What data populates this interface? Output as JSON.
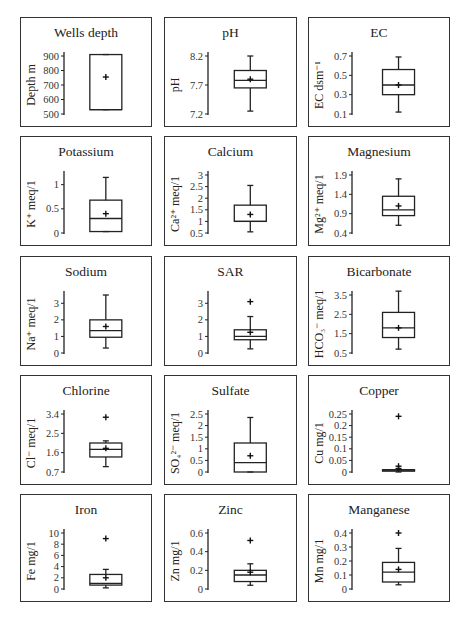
{
  "chart_data": [
    {
      "type": "box",
      "title": "Wells depth",
      "ylabel": "Depth m",
      "yticks": [
        "500",
        "600",
        "700",
        "800",
        "900"
      ],
      "ylim": [
        500,
        900
      ],
      "box": {
        "min": 530,
        "q1": 530,
        "median": 530,
        "q3": 910,
        "max": 910,
        "mean": 755,
        "outliers": []
      }
    },
    {
      "type": "box",
      "title": "pH",
      "ylabel": "pH",
      "yticks": [
        "7.2",
        "7.7",
        "8.2"
      ],
      "ylim": [
        7.2,
        8.2
      ],
      "box": {
        "min": 7.25,
        "q1": 7.65,
        "median": 7.78,
        "q3": 7.95,
        "max": 8.2,
        "mean": 7.8,
        "outliers": []
      }
    },
    {
      "type": "box",
      "title": "EC",
      "ylabel": "EC dsm-1",
      "yticks": [
        "0.1",
        "0.3",
        "0.5",
        "0.7"
      ],
      "ylim": [
        0.1,
        0.7
      ],
      "box": {
        "min": 0.12,
        "q1": 0.3,
        "median": 0.4,
        "q3": 0.56,
        "max": 0.69,
        "mean": 0.4,
        "outliers": []
      }
    },
    {
      "type": "box",
      "title": "Potassium",
      "ylabel": "K+ meq/1",
      "yticks": [
        "0",
        "0.5",
        "1"
      ],
      "ylim": [
        0,
        1.2
      ],
      "box": {
        "min": 0.03,
        "q1": 0.03,
        "median": 0.3,
        "q3": 0.68,
        "max": 1.15,
        "mean": 0.4,
        "outliers": []
      }
    },
    {
      "type": "box",
      "title": "Calcium",
      "ylabel": "Ca2+ meq/1",
      "yticks": [
        "0.5",
        "1",
        "1.5",
        "2",
        "2.5",
        "3"
      ],
      "ylim": [
        0.5,
        3
      ],
      "box": {
        "min": 0.55,
        "q1": 1.0,
        "median": 1.0,
        "q3": 1.7,
        "max": 2.55,
        "mean": 1.3,
        "outliers": []
      }
    },
    {
      "type": "box",
      "title": "Magnesium",
      "ylabel": "Mg2+ meq/1",
      "yticks": [
        "0.4",
        "0.9",
        "1.4",
        "1.9"
      ],
      "ylim": [
        0.4,
        1.9
      ],
      "box": {
        "min": 0.6,
        "q1": 0.85,
        "median": 1.0,
        "q3": 1.35,
        "max": 1.8,
        "mean": 1.1,
        "outliers": []
      }
    },
    {
      "type": "box",
      "title": "Sodium",
      "ylabel": "Na+ meq/1",
      "yticks": [
        "0",
        "1",
        "2",
        "3"
      ],
      "ylim": [
        0,
        3.5
      ],
      "box": {
        "min": 0.3,
        "q1": 0.95,
        "median": 1.35,
        "q3": 2.0,
        "max": 3.5,
        "mean": 1.6,
        "outliers": []
      }
    },
    {
      "type": "box",
      "title": "SAR",
      "ylabel": "",
      "yticks": [
        "0",
        "1",
        "2",
        "3"
      ],
      "ylim": [
        0,
        3.5
      ],
      "box": {
        "min": 0.25,
        "q1": 0.8,
        "median": 1.0,
        "q3": 1.4,
        "max": 2.2,
        "mean": 1.25,
        "outliers": [
          3.1
        ]
      }
    },
    {
      "type": "box",
      "title": "Bicarbonate",
      "ylabel": "HCO3- meq/1",
      "yticks": [
        "0.5",
        "1.5",
        "2.5",
        "3.5"
      ],
      "ylim": [
        0.5,
        3.5
      ],
      "box": {
        "min": 0.7,
        "q1": 1.3,
        "median": 1.8,
        "q3": 2.6,
        "max": 3.7,
        "mean": 1.8,
        "outliers": []
      }
    },
    {
      "type": "box",
      "title": "Chlorine",
      "ylabel": "Cl- meq/1",
      "yticks": [
        "0.7",
        "1.6",
        "2.5",
        "3.4"
      ],
      "ylim": [
        0.7,
        3.4
      ],
      "box": {
        "min": 0.95,
        "q1": 1.4,
        "median": 1.75,
        "q3": 2.05,
        "max": 2.15,
        "mean": 1.8,
        "outliers": [
          3.25
        ]
      }
    },
    {
      "type": "box",
      "title": "Sulfate",
      "ylabel": "SO42- meq/1",
      "yticks": [
        "0",
        "0.5",
        "1",
        "1.5",
        "2",
        "2.5"
      ],
      "ylim": [
        0,
        2.5
      ],
      "box": {
        "min": 0.0,
        "q1": 0.0,
        "median": 0.4,
        "q3": 1.25,
        "max": 2.35,
        "mean": 0.7,
        "outliers": []
      }
    },
    {
      "type": "box",
      "title": "Copper",
      "ylabel": "Cu mg/1",
      "yticks": [
        "0",
        "0.05",
        "0.1",
        "0.15",
        "0.2",
        "0.25"
      ],
      "ylim": [
        0,
        0.25
      ],
      "box": {
        "min": 0.0,
        "q1": 0.005,
        "median": 0.008,
        "q3": 0.01,
        "max": 0.01,
        "mean": 0.015,
        "outliers": [
          0.24,
          0.025
        ]
      }
    },
    {
      "type": "box",
      "title": "Iron",
      "ylabel": "Fe mg/1",
      "yticks": [
        "0",
        "2",
        "4",
        "6",
        "8",
        "10"
      ],
      "ylim": [
        0,
        10
      ],
      "box": {
        "min": 0.2,
        "q1": 0.7,
        "median": 1.0,
        "q3": 2.6,
        "max": 3.5,
        "mean": 2.0,
        "outliers": [
          9.0
        ]
      }
    },
    {
      "type": "box",
      "title": "Zinc",
      "ylabel": "Zn mg/1",
      "yticks": [
        "0",
        "0.2",
        "0.4",
        "0.6"
      ],
      "ylim": [
        0,
        0.6
      ],
      "box": {
        "min": 0.04,
        "q1": 0.08,
        "median": 0.15,
        "q3": 0.2,
        "max": 0.27,
        "mean": 0.18,
        "outliers": [
          0.52
        ]
      }
    },
    {
      "type": "box",
      "title": "Manganese",
      "ylabel": "Mn mg/1",
      "yticks": [
        "0",
        "0.1",
        "0.2",
        "0.3",
        "0.4"
      ],
      "ylim": [
        0,
        0.4
      ],
      "box": {
        "min": 0.03,
        "q1": 0.05,
        "median": 0.12,
        "q3": 0.19,
        "max": 0.29,
        "mean": 0.14,
        "outliers": [
          0.4
        ]
      }
    }
  ],
  "panels": [
    {
      "title": "Wells depth",
      "ylabel": "Depth m"
    },
    {
      "title": "pH",
      "ylabel": "pH"
    },
    {
      "title": "EC",
      "ylabel": "EC dsm⁻¹"
    },
    {
      "title": "Potassium",
      "ylabel": "K⁺ meq/1"
    },
    {
      "title": "Calcium",
      "ylabel": "Ca²⁺ meq/1"
    },
    {
      "title": "Magnesium",
      "ylabel": "Mg²⁺ meq/1"
    },
    {
      "title": "Sodium",
      "ylabel": "Na⁺ meq/1"
    },
    {
      "title": "SAR",
      "ylabel": ""
    },
    {
      "title": "Bicarbonate",
      "ylabel": "HCO₃⁻ meq/1"
    },
    {
      "title": "Chlorine",
      "ylabel": "Cl⁻ meq/1"
    },
    {
      "title": "Sulfate",
      "ylabel": "SO₄²⁻ meq/1"
    },
    {
      "title": "Copper",
      "ylabel": "Cu mg/1"
    },
    {
      "title": "Iron",
      "ylabel": "Fe mg/1"
    },
    {
      "title": "Zinc",
      "ylabel": "Zn mg/1"
    },
    {
      "title": "Manganese",
      "ylabel": "Mn mg/1"
    }
  ]
}
